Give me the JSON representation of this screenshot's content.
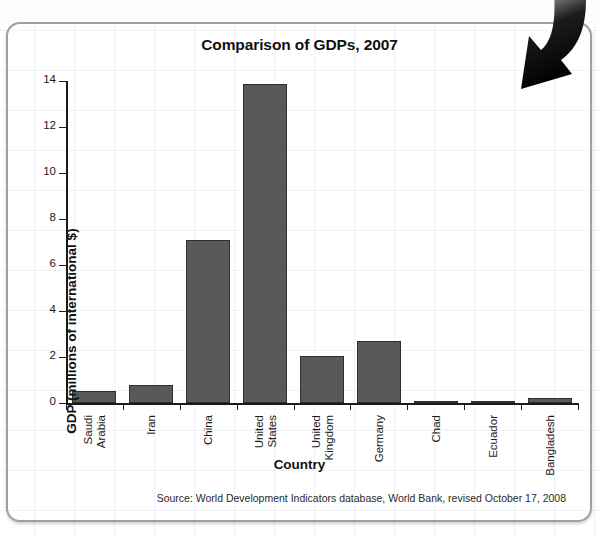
{
  "chart_data": {
    "type": "bar",
    "title": "Comparison of GDPs, 2007",
    "xlabel": "Country",
    "ylabel": "GDP (millions of international $)",
    "categories": [
      "Saudi\nArabia",
      "Iran",
      "China",
      "United\nStates",
      "United\nKingdom",
      "Germany",
      "Chad",
      "Ecuador",
      "Bangladesh"
    ],
    "values": [
      0.52,
      0.77,
      7.1,
      13.85,
      2.05,
      2.7,
      0.02,
      0.1,
      0.22
    ],
    "ylim": [
      0,
      14
    ],
    "yticks": [
      0,
      2,
      4,
      6,
      8,
      10,
      12,
      14
    ],
    "ytick_labels": [
      "0",
      "2",
      "4",
      "6",
      "8",
      "10",
      "12",
      "14"
    ],
    "grid": false,
    "legend": "none",
    "bar_color": "#595959",
    "bar_border_color": "#2e2e2e",
    "source": "Source: World Development Indicators database, World Bank, revised October 17, 2008"
  },
  "annotations": {
    "arrow": "curved-down-arrow-icon"
  },
  "panel": {
    "border_color": "#9ba0a6"
  }
}
